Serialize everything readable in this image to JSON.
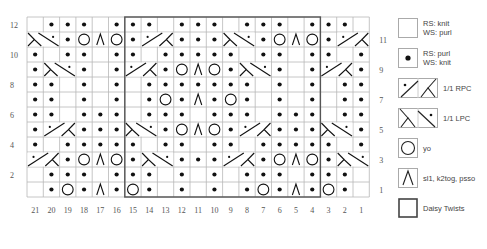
{
  "chart": {
    "type": "knitting-chart",
    "columns": 21,
    "rows": 12,
    "column_labels": [
      "21",
      "20",
      "19",
      "18",
      "17",
      "16",
      "15",
      "14",
      "13",
      "12",
      "11",
      "10",
      "9",
      "8",
      "7",
      "6",
      "5",
      "4",
      "3",
      "2",
      "1"
    ],
    "row_labels_left": [
      "12",
      "10",
      "8",
      "6",
      "4",
      "2"
    ],
    "row_labels_right": [
      "11",
      "9",
      "7",
      "5",
      "3",
      "1"
    ],
    "repeat_box": {
      "label": "Daisy Twists",
      "from_column": 15,
      "to_column": 4,
      "from_row": 1,
      "to_row": 12
    },
    "grid_rows": [
      {
        "row": 12,
        "cells": [
          "k",
          "p",
          "p",
          "p",
          "k",
          "p",
          "p",
          "p",
          "k",
          "p",
          "p",
          "p",
          "k",
          "p",
          "p",
          "p",
          "k",
          "p",
          "p",
          "p",
          "k"
        ]
      },
      {
        "row": 11,
        "cells": [
          "LPC",
          "LPC",
          "p",
          "yo",
          "sk2p",
          "yo",
          "p",
          "RPC",
          "RPC",
          "p",
          "p",
          "p",
          "LPC",
          "LPC",
          "p",
          "yo",
          "sk2p",
          "yo",
          "p",
          "RPC",
          "RPC"
        ]
      },
      {
        "row": 10,
        "cells": [
          "p",
          "k",
          "p",
          "p",
          "k",
          "p",
          "p",
          "k",
          "p",
          "p",
          "p",
          "p",
          "p",
          "k",
          "p",
          "p",
          "k",
          "p",
          "p",
          "k",
          "p"
        ]
      },
      {
        "row": 9,
        "cells": [
          "p",
          "LPC",
          "LPC",
          "p",
          "k",
          "p",
          "RPC",
          "RPC",
          "p",
          "yo",
          "sk2p",
          "yo",
          "p",
          "LPC",
          "LPC",
          "p",
          "k",
          "p",
          "RPC",
          "RPC",
          "p"
        ]
      },
      {
        "row": 8,
        "cells": [
          "p",
          "p",
          "k",
          "p",
          "k",
          "p",
          "k",
          "p",
          "p",
          "p",
          "p",
          "p",
          "p",
          "p",
          "k",
          "p",
          "k",
          "p",
          "k",
          "p",
          "p"
        ]
      },
      {
        "row": 7,
        "cells": [
          "p",
          "p",
          "k",
          "p",
          "k",
          "p",
          "k",
          "p",
          "yo",
          "p",
          "sk2p",
          "p",
          "yo",
          "p",
          "k",
          "p",
          "k",
          "p",
          "k",
          "p",
          "p"
        ]
      },
      {
        "row": 6,
        "cells": [
          "p",
          "p",
          "k",
          "p",
          "p",
          "p",
          "k",
          "p",
          "p",
          "p",
          "k",
          "p",
          "p",
          "p",
          "k",
          "p",
          "p",
          "p",
          "k",
          "p",
          "p"
        ]
      },
      {
        "row": 5,
        "cells": [
          "p",
          "RPC",
          "RPC",
          "p",
          "p",
          "p",
          "LPC",
          "LPC",
          "p",
          "yo",
          "sk2p",
          "yo",
          "p",
          "RPC",
          "RPC",
          "p",
          "p",
          "p",
          "LPC",
          "LPC",
          "p"
        ]
      },
      {
        "row": 4,
        "cells": [
          "p",
          "k",
          "p",
          "p",
          "p",
          "p",
          "p",
          "k",
          "p",
          "p",
          "k",
          "p",
          "p",
          "k",
          "p",
          "p",
          "p",
          "p",
          "p",
          "k",
          "p"
        ]
      },
      {
        "row": 3,
        "cells": [
          "RPC",
          "RPC",
          "p",
          "yo",
          "sk2p",
          "yo",
          "p",
          "LPC",
          "LPC",
          "p",
          "p",
          "p",
          "RPC",
          "RPC",
          "p",
          "yo",
          "sk2p",
          "yo",
          "p",
          "LPC",
          "LPC"
        ]
      },
      {
        "row": 2,
        "cells": [
          "k",
          "p",
          "p",
          "p",
          "k",
          "p",
          "p",
          "p",
          "k",
          "p",
          "k",
          "p",
          "k",
          "p",
          "p",
          "p",
          "k",
          "p",
          "p",
          "p",
          "k"
        ]
      },
      {
        "row": 1,
        "cells": [
          "k",
          "p",
          "yo",
          "p",
          "sk2p",
          "p",
          "yo",
          "p",
          "k",
          "p",
          "k",
          "p",
          "k",
          "p",
          "yo",
          "p",
          "sk2p",
          "p",
          "yo",
          "p",
          "k"
        ]
      }
    ],
    "colors": {
      "grid_line": "#b8b8b8",
      "bold_outline": "#555555",
      "symbol": "#111111",
      "label": "#555555"
    }
  },
  "legend": {
    "items": [
      {
        "key": "k",
        "symbol": "blank-square",
        "label": "RS: knit\nWS: purl"
      },
      {
        "key": "p",
        "symbol": "dot",
        "label": "RS: purl\nWS: knit"
      },
      {
        "key": "RPC",
        "symbol": "rpc-cable",
        "label": "1/1 RPC"
      },
      {
        "key": "LPC",
        "symbol": "lpc-cable",
        "label": "1/1 LPC"
      },
      {
        "key": "yo",
        "symbol": "circle",
        "label": "yo"
      },
      {
        "key": "sk2p",
        "symbol": "caret",
        "label": "sl1, k2tog, psso"
      },
      {
        "key": "box",
        "symbol": "bold-square",
        "label": "Daisy Twists"
      }
    ]
  }
}
